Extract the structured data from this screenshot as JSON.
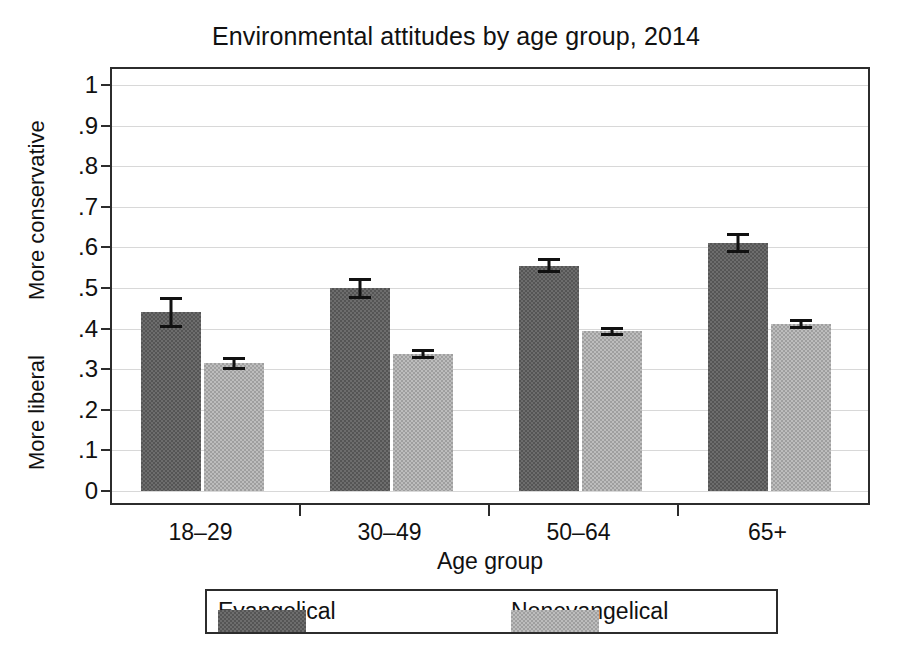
{
  "chart_data": {
    "type": "bar",
    "title": "Environmental attitudes by age group, 2014",
    "xlabel": "Age group",
    "ylabel": "",
    "y_axis_top_caption": "More conservative",
    "y_axis_bottom_caption": "More liberal",
    "categories": [
      "18–29",
      "30–49",
      "50–64",
      "65+"
    ],
    "ylim": [
      0,
      1
    ],
    "ytick_labels": [
      "0",
      ".1",
      ".2",
      ".3",
      ".4",
      ".5",
      ".6",
      ".7",
      ".8",
      ".9",
      "1"
    ],
    "ytick_values": [
      0,
      0.1,
      0.2,
      0.3,
      0.4,
      0.5,
      0.6,
      0.7,
      0.8,
      0.9,
      1
    ],
    "grid": true,
    "legend_position": "bottom",
    "series": [
      {
        "name": "Evangelical",
        "color": "#6d6d6d",
        "values": [
          0.44,
          0.5,
          0.555,
          0.61
        ],
        "err_low": [
          0.402,
          0.474,
          0.538,
          0.586
        ],
        "err_high": [
          0.477,
          0.525,
          0.573,
          0.635
        ]
      },
      {
        "name": "Nonevangelical",
        "color": "#bdbdbd",
        "values": [
          0.315,
          0.338,
          0.393,
          0.411
        ],
        "err_low": [
          0.299,
          0.326,
          0.382,
          0.399
        ],
        "err_high": [
          0.331,
          0.35,
          0.404,
          0.424
        ]
      }
    ]
  }
}
